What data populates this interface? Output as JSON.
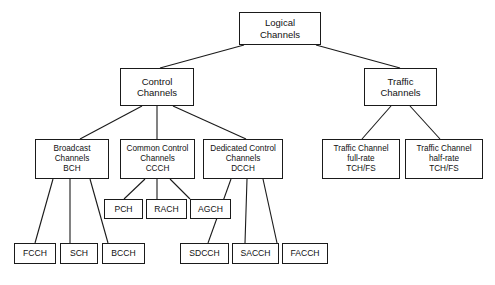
{
  "diagram": {
    "line_color": "#1a1a1a",
    "box_fill": "#ffffff",
    "text_color": "#111111",
    "caption": ""
  },
  "nodes": {
    "logical_channels": {
      "line1": "Logical",
      "line2": "Channels",
      "line3": ""
    },
    "control_channels": {
      "line1": "Control",
      "line2": "Channels",
      "line3": ""
    },
    "traffic_channels": {
      "line1": "Traffic",
      "line2": "Channels",
      "line3": ""
    },
    "broadcast_channels": {
      "line1": "Broadcast",
      "line2": "Channels",
      "line3": "BCH"
    },
    "common_control_channels": {
      "line1": "Common Control",
      "line2": "Channels",
      "line3": "CCCH"
    },
    "dedicated_control_channels": {
      "line1": "Dedicated Control",
      "line2": "Channels",
      "line3": "DCCH"
    },
    "traffic_channel_full_rate": {
      "line1": "Traffic Channel",
      "line2": "full-rate",
      "line3": "TCH/FS"
    },
    "traffic_channel_half_rate": {
      "line1": "Traffic Channel",
      "line2": "half-rate",
      "line3": "TCH/FS"
    },
    "fcch": {
      "line1": "FCCH",
      "line2": "",
      "line3": ""
    },
    "sch": {
      "line1": "SCH",
      "line2": "",
      "line3": ""
    },
    "bcch": {
      "line1": "BCCH",
      "line2": "",
      "line3": ""
    },
    "pch": {
      "line1": "PCH",
      "line2": "",
      "line3": ""
    },
    "rach": {
      "line1": "RACH",
      "line2": "",
      "line3": ""
    },
    "agch": {
      "line1": "AGCH",
      "line2": "",
      "line3": ""
    },
    "sdcch": {
      "line1": "SDCCH",
      "line2": "",
      "line3": ""
    },
    "sacch": {
      "line1": "SACCH",
      "line2": "",
      "line3": ""
    },
    "facch": {
      "line1": "FACCH",
      "line2": "",
      "line3": ""
    }
  }
}
